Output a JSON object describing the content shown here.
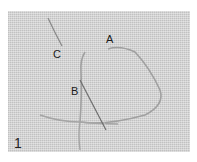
{
  "figure": {
    "number": "1",
    "labels": [
      {
        "id": "A",
        "text": "A"
      },
      {
        "id": "B",
        "text": "B"
      },
      {
        "id": "C",
        "text": "C"
      }
    ],
    "colors": {
      "fabric": "#d2d2d2",
      "thread": "#9a9a9a",
      "needle": "#6e6e6e"
    }
  }
}
